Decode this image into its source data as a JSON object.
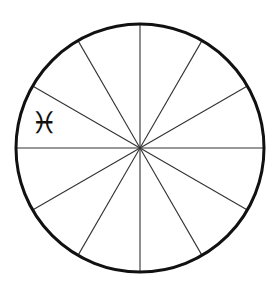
{
  "diagram": {
    "type": "zodiac-wheel",
    "center": [
      140,
      148
    ],
    "radius": 124,
    "segments": 12,
    "circle_stroke": "#111111",
    "circle_stroke_width": 3,
    "spoke_stroke": "#333333",
    "spoke_stroke_width": 1.1,
    "labels": [
      {
        "sign": "Pisces",
        "glyph": "♓",
        "x": 31,
        "y": 108,
        "size": 30
      }
    ]
  }
}
